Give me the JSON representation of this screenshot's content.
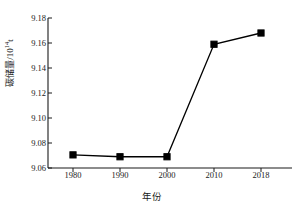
{
  "chart_data": {
    "type": "line",
    "title": "",
    "xlabel": "年份",
    "ylabel": "碳储量/10",
    "ylabel_superscript": "14",
    "ylabel_unit": "t",
    "ylabel_full": "碳储量/10¹⁴t",
    "categories": [
      "1980",
      "1990",
      "2000",
      "2010",
      "2018"
    ],
    "values": [
      9.0705,
      9.069,
      9.069,
      9.159,
      9.168
    ],
    "series": [
      {
        "name": "碳储量",
        "values": [
          9.0705,
          9.069,
          9.069,
          9.159,
          9.168
        ],
        "color": "#000000",
        "marker": "square",
        "marker_filled": true
      }
    ],
    "ylim": [
      9.06,
      9.18
    ],
    "yticks": [
      "9.06",
      "9.08",
      "9.10",
      "9.12",
      "9.14",
      "9.16",
      "9.18"
    ],
    "ytick_values": [
      9.06,
      9.08,
      9.1,
      9.12,
      9.14,
      9.16,
      9.18
    ],
    "xticks": [
      "1980",
      "1990",
      "2000",
      "2010",
      "2018"
    ],
    "grid": false,
    "legend": false,
    "legend_position": "none",
    "spines": [
      "left",
      "bottom"
    ],
    "background": "#ffffff",
    "line_color": "#000000",
    "marker_color": "#000000"
  },
  "geometry": {
    "plot_left": 48,
    "plot_right": 292,
    "plot_top": 18,
    "plot_bottom": 168,
    "tick_x": [
      73,
      120,
      167,
      214,
      261
    ],
    "point_y": [
      157.6,
      159.5,
      159.5,
      46.3,
      35.0
    ],
    "ytick_y": [
      168,
      143,
      118,
      93,
      68,
      43,
      18
    ]
  }
}
